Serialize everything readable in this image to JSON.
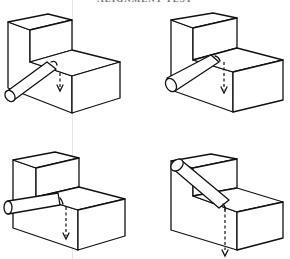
{
  "figure": {
    "caption": "ALIGNMENT TEST",
    "panels": [
      {
        "id": "top-left",
        "cylinder_position": "lower-left diagonal into inner corner",
        "arrow": "dashed downward with curl at cylinder tip"
      },
      {
        "id": "top-right",
        "cylinder_position": "lower-left diagonal resting on step edge",
        "arrow": "dashed downward from step edge"
      },
      {
        "id": "bottom-left",
        "cylinder_position": "horizontal across step edge",
        "arrow": "dashed downward from step edge"
      },
      {
        "id": "bottom-right",
        "cylinder_position": "diagonal from top of tall block down to step",
        "arrow": "dashed downward through front edge"
      }
    ],
    "colors": {
      "line": "#111111",
      "background": "#ffffff"
    }
  }
}
